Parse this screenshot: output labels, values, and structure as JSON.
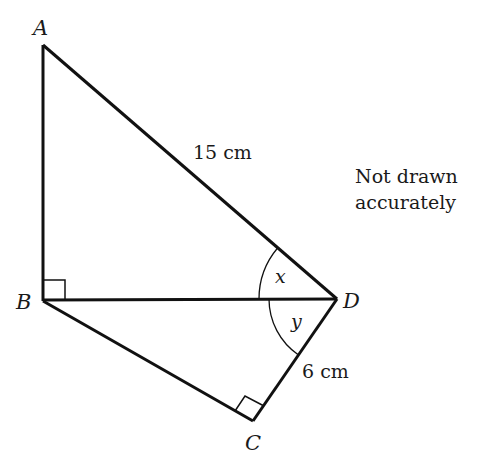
{
  "diagram": {
    "points": {
      "A": {
        "label": "A",
        "x": 43,
        "y": 45
      },
      "B": {
        "label": "B",
        "x": 43,
        "y": 301
      },
      "C": {
        "label": "C",
        "x": 253,
        "y": 421
      },
      "D": {
        "label": "D",
        "x": 337,
        "y": 299
      }
    },
    "segments": [
      {
        "from": "A",
        "to": "B"
      },
      {
        "from": "A",
        "to": "D"
      },
      {
        "from": "B",
        "to": "D"
      },
      {
        "from": "B",
        "to": "C"
      },
      {
        "from": "C",
        "to": "D"
      }
    ],
    "right_angles": [
      "B",
      "C"
    ],
    "angles": {
      "x": {
        "label": "x",
        "at": "D",
        "between": [
          "A",
          "B"
        ]
      },
      "y": {
        "label": "y",
        "at": "D",
        "between": [
          "B",
          "C"
        ]
      }
    },
    "measurements": {
      "AD": "15 cm",
      "CD": "6 cm"
    },
    "note": {
      "line1": "Not drawn",
      "line2": "accurately"
    },
    "colors": {
      "line": "#111111",
      "text": "#1a1a1a"
    }
  }
}
